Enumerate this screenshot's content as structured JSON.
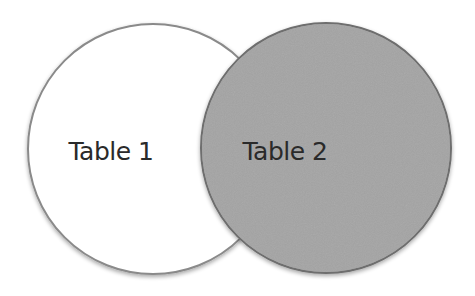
{
  "diagram": {
    "type": "venn",
    "sets": [
      {
        "id": "table1",
        "label": "Table 1",
        "fill": "#ffffff",
        "stroke": "#8a8a8a",
        "cx": 153,
        "cy": 149,
        "rx": 125,
        "ry": 125
      },
      {
        "id": "table2",
        "label": "Table 2",
        "fill": "#a4a4a4",
        "stroke": "#6e6e6e",
        "cx": 326,
        "cy": 148,
        "rx": 125,
        "ry": 125
      }
    ],
    "overlap_shaded_by": "Table 2"
  }
}
